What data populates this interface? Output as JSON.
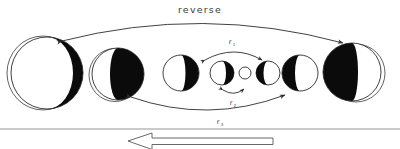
{
  "figure": {
    "title": "reverse",
    "background_color": "#ffffff",
    "ink_color": "#0b0b0b",
    "outline_color": "#2b2b2b",
    "rule_color": "#8a8a8a",
    "caption_arrow_direction": "left"
  },
  "labels": {
    "reverse": "reverse",
    "r_top": "r",
    "r_top_sub": "1",
    "r_inner": "r",
    "r_inner_sub": "2",
    "r_bottom": "r",
    "r_bottom_sub": "3"
  },
  "phases": [
    {
      "id": "phase-1",
      "cx": 47,
      "cy": 73,
      "r": 36,
      "dark_side": "full",
      "terminator": -0.72,
      "halo": true
    },
    {
      "id": "phase-2",
      "cx": 118,
      "cy": 74,
      "r": 26,
      "dark_side": "right",
      "terminator": -0.28,
      "halo": true
    },
    {
      "id": "phase-3",
      "cx": 181,
      "cy": 73,
      "r": 18,
      "dark_side": "right",
      "terminator": 0.18,
      "halo": false
    },
    {
      "id": "phase-4",
      "cx": 222,
      "cy": 73,
      "r": 12,
      "dark_side": "right",
      "terminator": 0.3,
      "halo": false
    },
    {
      "id": "phase-5",
      "cx": 245,
      "cy": 73,
      "r": 6,
      "dark_side": "none",
      "terminator": 1.0,
      "halo": false
    },
    {
      "id": "phase-6",
      "cx": 268,
      "cy": 73,
      "r": 12,
      "dark_side": "left",
      "terminator": 0.34,
      "halo": false
    },
    {
      "id": "phase-7",
      "cx": 300,
      "cy": 73,
      "r": 18,
      "dark_side": "left",
      "terminator": 0.22,
      "halo": false
    },
    {
      "id": "phase-8",
      "cx": 352,
      "cy": 72,
      "r": 29,
      "dark_side": "left",
      "terminator": -0.18,
      "halo": true
    }
  ],
  "arrows": {
    "outer_top": {
      "from_x": 60,
      "from_y": 40,
      "to_x": 345,
      "to_y": 42,
      "bow": -28,
      "heads": "both"
    },
    "inner_mid": {
      "from_x": 203,
      "from_y": 60,
      "to_x": 263,
      "to_y": 60,
      "bow": -11,
      "heads": "both"
    },
    "inner_low": {
      "from_x": 221,
      "from_y": 90,
      "to_x": 245,
      "to_y": 90,
      "bow": 7,
      "heads": "both"
    },
    "outer_low": {
      "from_x": 128,
      "from_y": 96,
      "to_x": 288,
      "to_y": 96,
      "bow": 16,
      "heads": "both"
    }
  },
  "caption": {
    "rule_y": 129,
    "arrow_tip_x": 128,
    "arrow_tail_x": 273,
    "arrow_y": 141
  }
}
